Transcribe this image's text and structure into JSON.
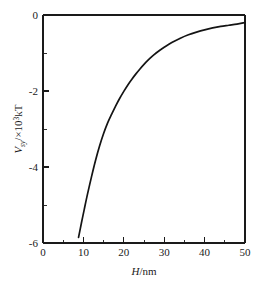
{
  "chart_data": {
    "type": "line",
    "title": "",
    "subtitle": "",
    "xlabel": "H/nm",
    "xlabel_parts": {
      "symbol": "H",
      "unit": "/nm"
    },
    "ylabel": "Vsy/×10³kT",
    "ylabel_parts": {
      "symbol": "V",
      "subscript": "sy",
      "slash": "/×10",
      "exponent": "3",
      "unit": "kT"
    },
    "xlim": [
      0,
      50
    ],
    "ylim": [
      -6,
      0
    ],
    "grid": false,
    "legend": false,
    "legend_position": "none",
    "xticks": [
      0,
      10,
      20,
      30,
      40,
      50
    ],
    "xtick_labels": [
      "0",
      "10",
      "20",
      "30",
      "40",
      "50"
    ],
    "xminor_ticks": [
      5,
      15,
      25,
      35,
      45
    ],
    "yticks": [
      0,
      -2,
      -4,
      -6
    ],
    "ytick_labels": [
      "0",
      "-2",
      "-4",
      "-6"
    ],
    "yminor_ticks": [
      -1,
      -3,
      -5
    ],
    "series": [
      {
        "name": "Vsy",
        "color": "#141414",
        "x": [
          8.8,
          9.5,
          10.2,
          11.0,
          12.0,
          13.0,
          14.0,
          15.0,
          16.0,
          17.0,
          18.0,
          19.0,
          20.0,
          21.0,
          22.0,
          23.0,
          24.0,
          25.0,
          26.0,
          27.0,
          28.0,
          29.0,
          30.0,
          32.0,
          34.0,
          36.0,
          38.0,
          40.0,
          42.0,
          44.0,
          46.0,
          48.0,
          50.0
        ],
        "y": [
          -5.85,
          -5.48,
          -5.12,
          -4.72,
          -4.26,
          -3.83,
          -3.45,
          -3.12,
          -2.84,
          -2.61,
          -2.39,
          -2.19,
          -2.01,
          -1.84,
          -1.69,
          -1.55,
          -1.42,
          -1.3,
          -1.19,
          -1.09,
          -1.0,
          -0.92,
          -0.85,
          -0.72,
          -0.61,
          -0.52,
          -0.45,
          -0.39,
          -0.34,
          -0.3,
          -0.27,
          -0.24,
          -0.2
        ]
      }
    ],
    "annotations": []
  },
  "figure": {
    "background": "#ffffff",
    "axis_color": "#1a1a1a",
    "plot_box": {
      "left": 43,
      "top": 15,
      "right": 245,
      "bottom": 243
    }
  }
}
